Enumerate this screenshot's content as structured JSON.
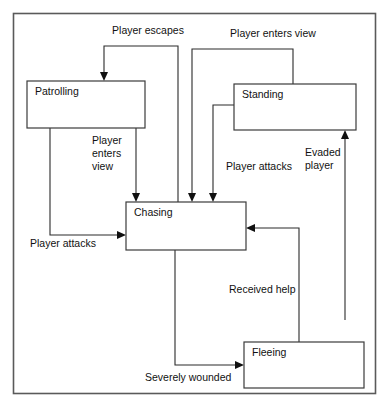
{
  "diagram": {
    "type": "state-machine-diagram",
    "frame": {
      "x": 13,
      "y": 13,
      "width": 363,
      "height": 381,
      "border_color": "#5a5a5a"
    },
    "colors": {
      "background": "#ffffff",
      "box_stroke": "#3b3b3b",
      "edge_stroke": "#2b2b2b",
      "text": "#111111"
    },
    "states": [
      {
        "id": "patrolling",
        "label": "Patrolling",
        "x": 27,
        "y": 81,
        "width": 118,
        "height": 47
      },
      {
        "id": "standing",
        "label": "Standing",
        "x": 234,
        "y": 84,
        "width": 122,
        "height": 46
      },
      {
        "id": "chasing",
        "label": "Chasing",
        "x": 126,
        "y": 202,
        "width": 120,
        "height": 48
      },
      {
        "id": "fleeing",
        "label": "Fleeing",
        "x": 244,
        "y": 342,
        "width": 120,
        "height": 46
      }
    ],
    "transitions": [
      {
        "id": "t1",
        "from": "chasing",
        "to": "patrolling",
        "label": "Player escapes",
        "label_x": 148,
        "label_y": 34
      },
      {
        "id": "t2",
        "from": "standing",
        "to": "chasing",
        "label": "Player enters view",
        "label_x": 273,
        "label_y": 37
      },
      {
        "id": "t3",
        "from": "patrolling",
        "to": "chasing",
        "label": "Player enters view",
        "label_x": 110,
        "label_y": 142
      },
      {
        "id": "t4",
        "from": "standing",
        "to": "chasing",
        "label": "Player attacks",
        "label_x": 226,
        "label_y": 167
      },
      {
        "id": "t5",
        "from": "patrolling",
        "to": "chasing",
        "label": "Player attacks",
        "label_x": 30,
        "label_y": 247
      },
      {
        "id": "t6",
        "from": "fleeing",
        "to": "chasing",
        "label": "Received help",
        "label_x": 229,
        "label_y": 290
      },
      {
        "id": "t7",
        "from": "fleeing",
        "to": "standing",
        "label": "Evaded player",
        "label_x": 305,
        "label_y": 159
      },
      {
        "id": "t8",
        "from": "chasing",
        "to": "fleeing",
        "label": "Severely wounded",
        "label_x": 145,
        "label_y": 380
      }
    ],
    "label_lines": {
      "t3_lines": [
        "Player",
        "enters",
        "view"
      ],
      "t7_lines": [
        "Evaded",
        "player"
      ]
    }
  }
}
